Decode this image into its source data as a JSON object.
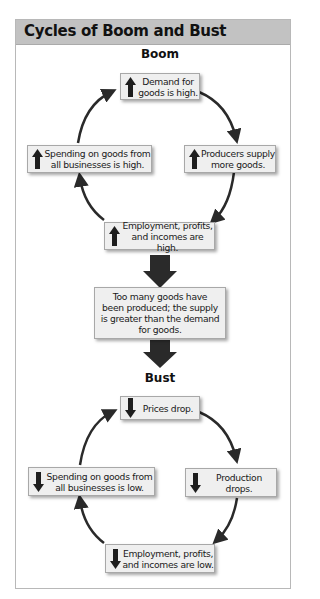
{
  "title": "Cycles of Boom and Bust",
  "colors": {
    "header_bg": "#c2c2c2",
    "box_bg": "#efefef",
    "arrow": "#2a2a2a",
    "frame_border": "#b8b8b8"
  },
  "boom": {
    "label": "Boom",
    "nodes": [
      {
        "id": "demand",
        "direction": "up",
        "line1": "Demand for",
        "line2": "goods is high."
      },
      {
        "id": "supply",
        "direction": "up",
        "line1": "Producers supply",
        "line2": "more goods."
      },
      {
        "id": "employment",
        "direction": "up",
        "line1": "Employment, profits,",
        "line2": "and incomes are high."
      },
      {
        "id": "spending",
        "direction": "up",
        "line1": "Spending on goods from",
        "line2": "all businesses is high."
      }
    ]
  },
  "transition": {
    "line1": "Too many goods have",
    "line2": "been produced; the supply",
    "line3": "is greater than the demand",
    "line4": "for goods."
  },
  "bust": {
    "label": "Bust",
    "nodes": [
      {
        "id": "prices",
        "direction": "down",
        "line1": "Prices drop."
      },
      {
        "id": "production",
        "direction": "down",
        "line1": "Production drops."
      },
      {
        "id": "employment",
        "direction": "down",
        "line1": "Employment, profits,",
        "line2": "and incomes are low."
      },
      {
        "id": "spending",
        "direction": "down",
        "line1": "Spending on goods from",
        "line2": "all businesses is low."
      }
    ]
  }
}
